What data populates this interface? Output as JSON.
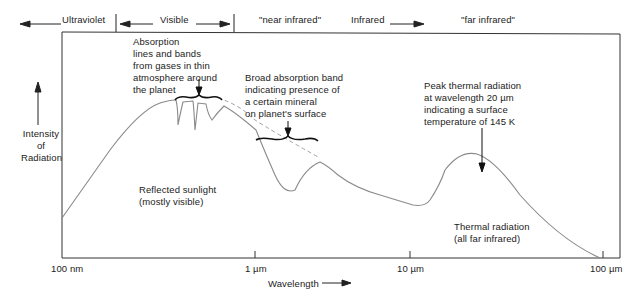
{
  "bands": {
    "ultraviolet": "Ultraviolet",
    "visible": "Visible",
    "near_infrared": "\"near infrared\"",
    "infrared": "Infrared",
    "far_infrared": "\"far infrared\""
  },
  "y_axis": {
    "label_line1": "Intensity",
    "label_line2": "of",
    "label_line3": "Radiation"
  },
  "x_axis": {
    "label": "Wavelength",
    "ticks": [
      "100 nm",
      "1 µm",
      "10 µm",
      "100 µm"
    ]
  },
  "annotations": {
    "absorption_lines": "Absorption\nlines and bands\nfrom gases in thin\natmosphere around\nthe planet",
    "broad_band": "Broad absorption band\nindicating presence of\na certain mineral\non planet's surface",
    "peak_thermal": "Peak thermal radiation\nat wavelength 20 µm\nindicating a surface\ntemperature of 145 K",
    "reflected": "Reflected sunlight\n(mostly visible)",
    "thermal": "Thermal radiation\n(all far infrared)"
  },
  "colors": {
    "curve": "#8a8a8a",
    "axis": "#333333",
    "text": "#222222"
  }
}
